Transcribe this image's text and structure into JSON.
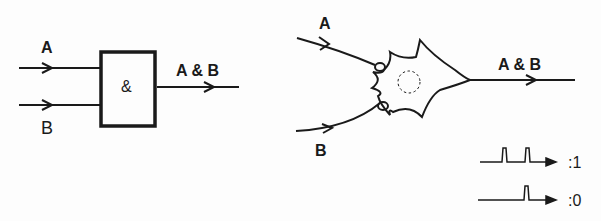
{
  "gate": {
    "input_a": "A",
    "input_b": "B",
    "symbol": "&",
    "output": "A & B"
  },
  "neuron": {
    "input_a": "A",
    "input_b": "B",
    "output": "A & B"
  },
  "signals": [
    {
      "pulses": 2,
      "label": ":1"
    },
    {
      "pulses": 1,
      "label": ":0"
    }
  ]
}
